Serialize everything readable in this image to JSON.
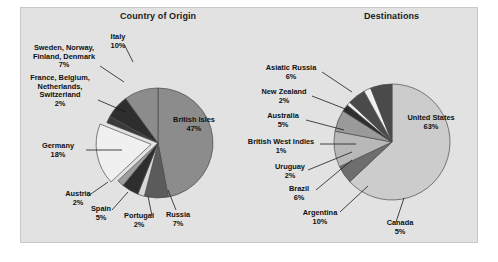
{
  "figure": {
    "background_color": "#e2e2e2",
    "page_color": "#ffffff",
    "border_color": "#c9c9c9"
  },
  "charts": {
    "origin": {
      "title": "Country of Origin",
      "center_x": 158,
      "center_y": 143,
      "radius": 55
    },
    "destinations": {
      "title": "Destinations",
      "center_x": 392,
      "center_y": 142,
      "radius": 58
    }
  },
  "labels": {
    "origin": {
      "italy": "Italy\n10%",
      "nordics": "Sweden, Norway,\nFinland, Denmark\n7%",
      "lowlands": "France, Belgium,\nNetherlands,\nSwitzerland\n2%",
      "germany": "Germany\n18%",
      "austria": "Austria\n2%",
      "spain": "Spain\n5%",
      "portugal": "Portugal\n2%",
      "russia": "Russia\n7%",
      "british_isles": "British Isles\n47%"
    },
    "destinations": {
      "asiatic_russia": "Asiatic Russia\n6%",
      "new_zealand": "New Zealand\n2%",
      "australia": "Australia\n5%",
      "bwi": "British West Indies\n1%",
      "uruguay": "Uruguay\n2%",
      "brazil": "Brazil\n6%",
      "argentina": "Argentina\n10%",
      "canada": "Canada\n5%",
      "united_states": "United States\n63%"
    }
  },
  "chart_data": [
    {
      "type": "pie",
      "title": "Country of Origin",
      "xlabel": "",
      "ylabel": "",
      "units": "percent",
      "legend": "none",
      "labels_position": "outside-with-leader-lines",
      "exploded_slices": [
        "Germany"
      ],
      "start_angle_deg": -90,
      "direction": "clockwise",
      "categories": [
        "British Isles",
        "Russia",
        "Portugal",
        "Spain",
        "Austria",
        "Germany",
        "France, Belgium, Netherlands, Switzerland",
        "Sweden, Norway, Finland, Denmark",
        "Italy"
      ],
      "values": [
        47,
        7,
        2,
        5,
        2,
        18,
        2,
        7,
        10
      ],
      "colors": [
        "#8c8c8c",
        "#5b5b5b",
        "#d8d8d8",
        "#2e2e2e",
        "#9e9e9e",
        "#f0f0f0",
        "#3a3a3a",
        "#2e2e2e",
        "#8c8c8c"
      ]
    },
    {
      "type": "pie",
      "title": "Destinations",
      "xlabel": "",
      "ylabel": "",
      "units": "percent",
      "legend": "none",
      "labels_position": "outside-with-leader-lines",
      "exploded_slices": [],
      "start_angle_deg": -90,
      "direction": "clockwise",
      "categories": [
        "United States",
        "Canada",
        "Argentina",
        "Brazil",
        "Uruguay",
        "British West Indies",
        "Australia",
        "New Zealand",
        "Asiatic Russia"
      ],
      "values": [
        63,
        5,
        10,
        6,
        2,
        1,
        5,
        2,
        6
      ],
      "colors": [
        "#cccccc",
        "#6e6e6e",
        "#b8b8b8",
        "#9a9a9a",
        "#2e2e2e",
        "#f0f0f0",
        "#4a4a4a",
        "#f0f0f0",
        "#4a4a4a"
      ]
    }
  ]
}
